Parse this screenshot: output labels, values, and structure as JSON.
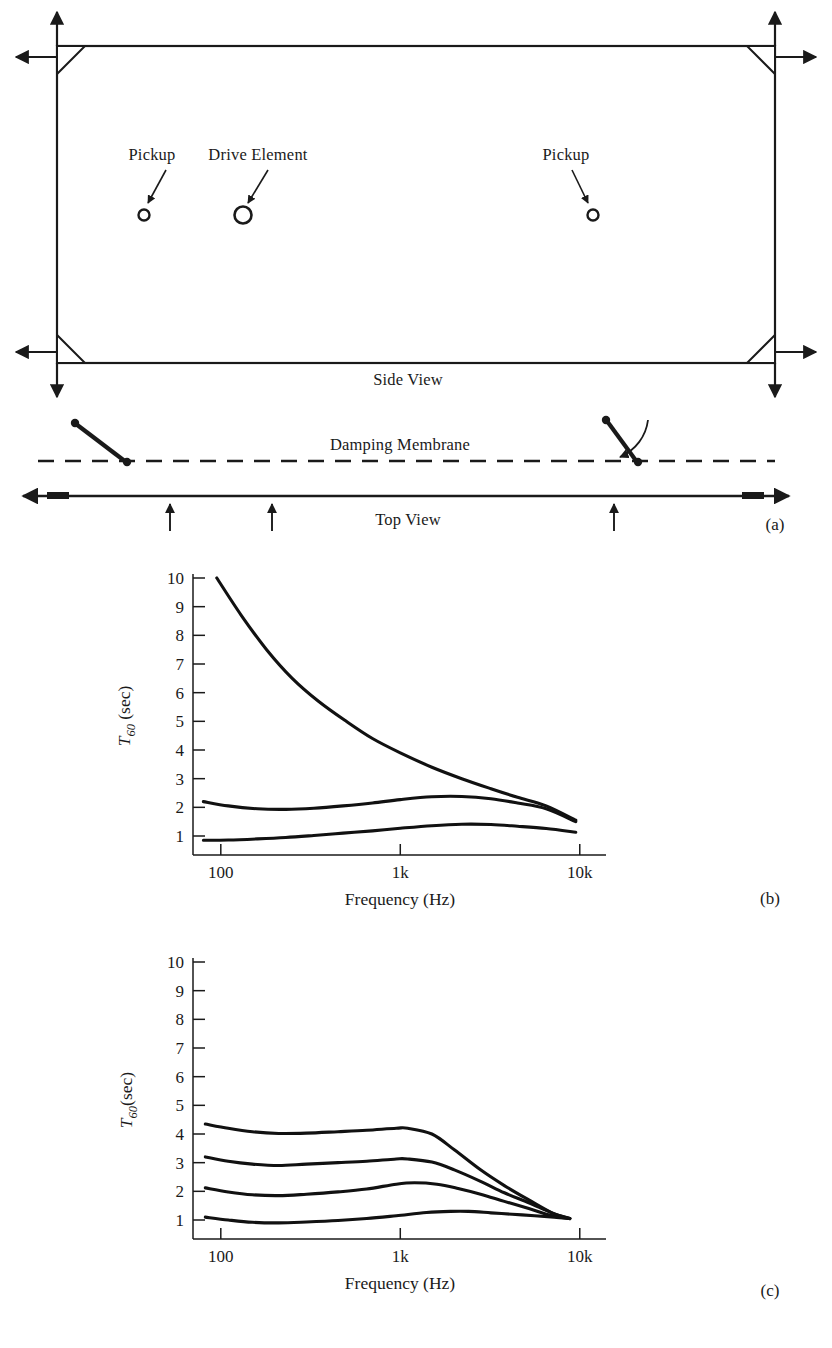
{
  "figure": {
    "panels": [
      {
        "id": "a",
        "caption": "(a)"
      },
      {
        "id": "b",
        "caption": "(b)"
      },
      {
        "id": "c",
        "caption": "(c)"
      }
    ]
  },
  "diagram": {
    "side_view_label": "Side View",
    "top_view_label": "Top View",
    "damping_membrane_label": "Damping Membrane",
    "pickup_left_label": "Pickup",
    "pickup_right_label": "Pickup",
    "drive_element_label": "Drive Element",
    "caption": "(a)"
  },
  "chart_data": [
    {
      "panel": "b",
      "type": "line",
      "title": "",
      "xlabel": "Frequency (Hz)",
      "ylabel": "T60 (sec)",
      "ylabel_main": "T",
      "ylabel_sub": "60",
      "ylabel_unit": " (sec)",
      "xscale": "log",
      "xlim": [
        70,
        14000
      ],
      "ylim": [
        0,
        10
      ],
      "xticks": [
        100,
        1000,
        10000
      ],
      "xticklabels": [
        "100",
        "1k",
        "10k"
      ],
      "yticks": [
        1,
        2,
        3,
        4,
        5,
        6,
        7,
        8,
        9,
        10
      ],
      "yticklabels": [
        "1",
        "2",
        "3",
        "4",
        "5",
        "6",
        "7",
        "8",
        "9",
        "10"
      ],
      "grid": false,
      "legend": "none",
      "caption": "(b)",
      "series": [
        {
          "name": "undamped",
          "x": [
            95,
            130,
            180,
            250,
            350,
            500,
            700,
            1000,
            1500,
            2200,
            3200,
            4500,
            6500,
            9500
          ],
          "y": [
            10.0,
            8.7,
            7.5,
            6.5,
            5.7,
            5.0,
            4.4,
            3.9,
            3.4,
            3.0,
            2.65,
            2.35,
            2.05,
            1.55
          ]
        },
        {
          "name": "medium damping",
          "x": [
            80,
            110,
            160,
            230,
            330,
            480,
            700,
            1000,
            1500,
            2200,
            3200,
            4500,
            6500,
            9500
          ],
          "y": [
            2.2,
            2.05,
            1.95,
            1.93,
            1.97,
            2.05,
            2.15,
            2.27,
            2.37,
            2.38,
            2.3,
            2.15,
            1.95,
            1.5
          ]
        },
        {
          "name": "heavy damping",
          "x": [
            80,
            110,
            160,
            230,
            330,
            480,
            700,
            1000,
            1500,
            2200,
            3200,
            4500,
            6500,
            9500
          ],
          "y": [
            0.85,
            0.86,
            0.9,
            0.95,
            1.02,
            1.1,
            1.18,
            1.27,
            1.36,
            1.41,
            1.4,
            1.34,
            1.26,
            1.13
          ]
        }
      ]
    },
    {
      "panel": "c",
      "type": "line",
      "title": "",
      "xlabel": "Frequency (Hz)",
      "ylabel": "T60 (sec)",
      "ylabel_main": "T",
      "ylabel_sub": "60",
      "ylabel_unit": "(sec)",
      "xscale": "log",
      "xlim": [
        70,
        14000
      ],
      "ylim": [
        0,
        10
      ],
      "xticks": [
        100,
        1000,
        10000
      ],
      "xticklabels": [
        "100",
        "1k",
        "10k"
      ],
      "yticks": [
        1,
        2,
        3,
        4,
        5,
        6,
        7,
        8,
        9,
        10
      ],
      "yticklabels": [
        "1",
        "2",
        "3",
        "4",
        "5",
        "6",
        "7",
        "8",
        "9",
        "10"
      ],
      "grid": false,
      "legend": "none",
      "caption": "(c)",
      "series": [
        {
          "name": "curve-1",
          "x": [
            82,
            110,
            150,
            210,
            300,
            450,
            650,
            950,
            1100,
            1500,
            2000,
            2800,
            3800,
            5200,
            7000,
            8800
          ],
          "y": [
            4.35,
            4.2,
            4.08,
            4.02,
            4.03,
            4.08,
            4.13,
            4.2,
            4.2,
            4.0,
            3.45,
            2.75,
            2.2,
            1.7,
            1.25,
            1.05
          ]
        },
        {
          "name": "curve-2",
          "x": [
            82,
            110,
            150,
            210,
            300,
            450,
            650,
            950,
            1100,
            1500,
            2000,
            2800,
            3800,
            5200,
            7000,
            8800
          ],
          "y": [
            3.2,
            3.05,
            2.95,
            2.9,
            2.95,
            3.0,
            3.05,
            3.13,
            3.13,
            3.02,
            2.75,
            2.35,
            1.95,
            1.6,
            1.25,
            1.05
          ]
        },
        {
          "name": "curve-3",
          "x": [
            82,
            110,
            150,
            210,
            300,
            450,
            650,
            950,
            1200,
            1600,
            2100,
            2800,
            3800,
            5200,
            7000,
            8800
          ],
          "y": [
            2.12,
            1.98,
            1.88,
            1.85,
            1.9,
            1.98,
            2.08,
            2.25,
            2.3,
            2.25,
            2.1,
            1.9,
            1.65,
            1.4,
            1.15,
            1.05
          ]
        },
        {
          "name": "curve-4",
          "x": [
            82,
            110,
            150,
            210,
            300,
            450,
            650,
            950,
            1400,
            1900,
            2400,
            3200,
            4200,
            5600,
            7200,
            8800
          ],
          "y": [
            1.1,
            1.0,
            0.92,
            0.9,
            0.93,
            0.98,
            1.05,
            1.15,
            1.26,
            1.3,
            1.3,
            1.25,
            1.2,
            1.15,
            1.1,
            1.05
          ]
        }
      ]
    }
  ],
  "bottom_bleed": {
    "text": ""
  }
}
